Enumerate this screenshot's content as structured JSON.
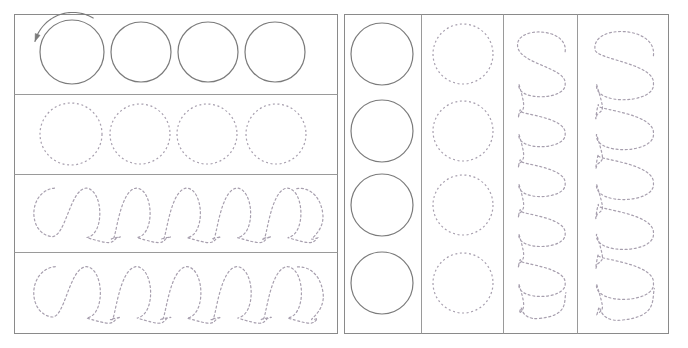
{
  "worksheet": {
    "title": "Circle and Loop Tracing Practice Worksheet",
    "canvas": {
      "width": 688,
      "height": 348,
      "background": "#ffffff"
    },
    "colors": {
      "frame_stroke": "#8a8a8a",
      "divider_stroke": "#9a9a9a",
      "solid_shape_stroke": "#7b7b7b",
      "dashed_shape_stroke": "#a79fae",
      "arrow_stroke": "#7b7b7b"
    },
    "stroke_widths": {
      "frame": 1,
      "divider": 1,
      "solid_shape": 1.2,
      "dashed_shape": 1.2,
      "arrow": 1.1
    },
    "dash_pattern": "2,2.6",
    "frames": [
      {
        "name": "left-panel",
        "x": 14,
        "y": 14,
        "width": 323,
        "height": 319
      },
      {
        "name": "right-panel",
        "x": 344,
        "y": 14,
        "width": 324,
        "height": 319
      }
    ],
    "left_panel_row_dividers_y": [
      94,
      174,
      252
    ],
    "right_panel_column_dividers_x": [
      421,
      503,
      577
    ],
    "rows": [
      {
        "index": 1,
        "name": "row-solid-circles",
        "style": "solid",
        "shape": "circle",
        "count": 4,
        "guide_arrow": {
          "present": true,
          "direction": "counterclockwise",
          "label": "stroke-direction-arrow"
        },
        "circles": [
          {
            "cx": 72,
            "cy": 52,
            "r": 32
          },
          {
            "cx": 141,
            "cy": 52,
            "r": 30
          },
          {
            "cx": 208,
            "cy": 52,
            "r": 30
          },
          {
            "cx": 275,
            "cy": 52,
            "r": 30
          }
        ]
      },
      {
        "index": 2,
        "name": "row-dashed-circles",
        "style": "dashed",
        "shape": "circle",
        "count": 4,
        "circles": [
          {
            "cx": 71,
            "cy": 134,
            "r": 31
          },
          {
            "cx": 140,
            "cy": 134,
            "r": 30
          },
          {
            "cx": 207,
            "cy": 134,
            "r": 30
          },
          {
            "cx": 276,
            "cy": 134,
            "r": 30
          }
        ]
      },
      {
        "index": 3,
        "name": "row-dashed-loops-a",
        "style": "dashed",
        "shape": "horizontal-loop-chain",
        "loop_count": 5,
        "band": {
          "y_top": 174,
          "y_bottom": 252
        }
      },
      {
        "index": 4,
        "name": "row-dashed-loops-b",
        "style": "dashed",
        "shape": "horizontal-loop-chain",
        "loop_count": 5,
        "band": {
          "y_top": 252,
          "y_bottom": 333
        }
      }
    ],
    "columns": [
      {
        "index": 1,
        "name": "column-solid-circles",
        "style": "solid",
        "shape": "circle",
        "count": 4,
        "circles": [
          {
            "cx": 382,
            "cy": 54,
            "r": 31
          },
          {
            "cx": 382,
            "cy": 131,
            "r": 31
          },
          {
            "cx": 382,
            "cy": 205,
            "r": 31
          },
          {
            "cx": 382,
            "cy": 283,
            "r": 31
          }
        ]
      },
      {
        "index": 2,
        "name": "column-dashed-circles",
        "style": "dashed",
        "shape": "circle",
        "count": 4,
        "circles": [
          {
            "cx": 463,
            "cy": 54,
            "r": 30
          },
          {
            "cx": 463,
            "cy": 131,
            "r": 30
          },
          {
            "cx": 463,
            "cy": 205,
            "r": 30
          },
          {
            "cx": 463,
            "cy": 283,
            "r": 30
          }
        ]
      },
      {
        "index": 3,
        "name": "column-dashed-loops-a",
        "style": "dashed",
        "shape": "vertical-loop-chain",
        "loop_count": 5,
        "band": {
          "x_left": 503,
          "x_right": 577
        }
      },
      {
        "index": 4,
        "name": "column-dashed-loops-b",
        "style": "dashed",
        "shape": "vertical-loop-chain",
        "loop_count": 5,
        "band": {
          "x_left": 577,
          "x_right": 668
        }
      }
    ]
  }
}
